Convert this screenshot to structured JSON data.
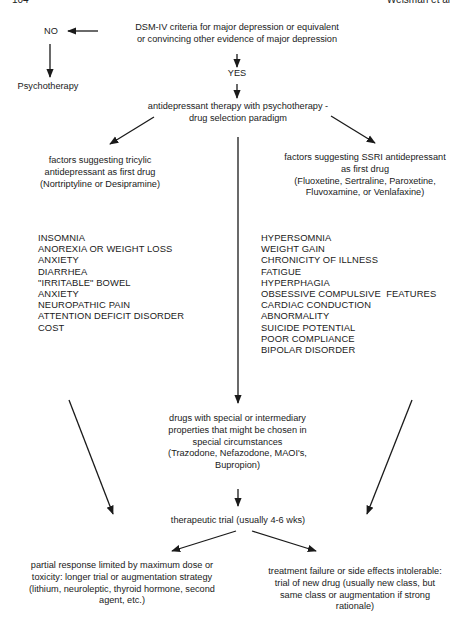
{
  "header": {
    "page_number": "104",
    "running_head": "Weisman et al"
  },
  "nodes": {
    "criteria": [
      "DSM-IV criteria for major depression or equivalent",
      "or convincing other evidence of major depression"
    ],
    "no": "NO",
    "psychotherapy": "Psychotherapy",
    "yes": "YES",
    "paradigm": [
      "antidepressant therapy with psychotherapy -",
      "drug selection paradigm"
    ],
    "tricyclic": [
      "factors suggesting tricylic",
      "antidepressant as first drug",
      "(Nortriptyline or Desipramine)"
    ],
    "ssri": [
      "factors suggesting SSRI antidepressant",
      "as first drug",
      "(Fluoxetine, Sertraline, Paroxetine,",
      "Fluvoxamine, or Venlafaxine)"
    ],
    "special": [
      "drugs with special or intermediary",
      "properties that might be chosen in",
      "special circumstances",
      "(Trazodone, Nefazodone, MAOI's,",
      "Bupropion)"
    ],
    "trial": "therapeutic trial (usually 4-6 wks)",
    "partial": [
      "partial response limited by maximum dose or",
      "toxicity: longer trial or augmentation strategy",
      "(lithium, neuroleptic, thyroid hormone, second",
      "agent, etc.)"
    ],
    "failure": [
      "treatment failure or side effects intolerable:",
      "trial of new drug (usually new class, but",
      "same class or augmentation if strong",
      "rationale)"
    ]
  },
  "tricyclic_factors": [
    "INSOMNIA",
    "ANOREXIA OR WEIGHT LOSS",
    "ANXIETY",
    "DIARRHEA",
    "\"IRRITABLE\" BOWEL",
    "ANXIETY",
    "NEUROPATHIC PAIN",
    "ATTENTION DEFICIT DISORDER",
    "COST"
  ],
  "ssri_factors": [
    "HYPERSOMNIA",
    "WEIGHT GAIN",
    "CHRONICITY OF ILLNESS",
    "FATIGUE",
    "HYPERPHAGIA",
    "OBSESSIVE COMPULSIVE  FEATURES",
    "CARDIAC CONDUCTION",
    "ABNORMALITY",
    "SUICIDE POTENTIAL",
    "POOR COMPLIANCE",
    "BIPOLAR DISORDER"
  ]
}
